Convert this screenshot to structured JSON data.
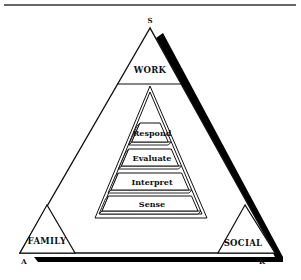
{
  "diagram": {
    "type": "nested-triangle-model",
    "vertices": {
      "top": "S",
      "bottom_left": "A",
      "bottom_right": "K"
    },
    "zones": {
      "top": "WORK",
      "bottom_left": "FAMILY",
      "bottom_right": "SOCIAL"
    },
    "stages_top_to_bottom": [
      "Respond",
      "Evaluate",
      "Interpret",
      "Sense"
    ],
    "colors": {
      "line": "#111111",
      "shadow": "#000000",
      "background": "#ffffff"
    }
  }
}
